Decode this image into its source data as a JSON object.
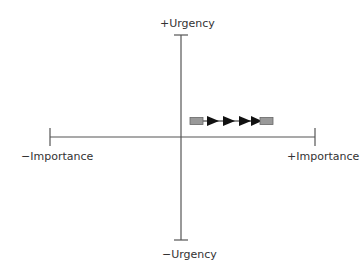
{
  "diagram": {
    "type": "quadrant-axes",
    "axes": {
      "vertical": {
        "top_label": "+Urgency",
        "bottom_label": "−Urgency"
      },
      "horizontal": {
        "left_label": "−Importance",
        "right_label": "+Importance"
      }
    },
    "marker": {
      "description": "horizontal progression arrow from one grey box to another with four arrowheads",
      "start_box_color": "#999999",
      "end_box_color": "#999999",
      "arrowhead_count": 4,
      "arrow_color": "#111111"
    },
    "colors": {
      "axis": "#555555",
      "text": "#333333"
    }
  }
}
